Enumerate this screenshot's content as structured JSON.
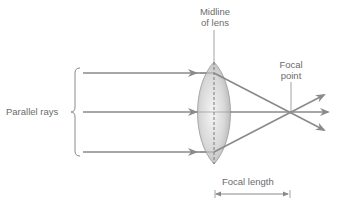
{
  "diagram": {
    "labels": {
      "midline_line1": "Midline",
      "midline_line2": "of lens",
      "focal_point_line1": "Focal",
      "focal_point_line2": "point",
      "parallel_rays": "Parallel rays",
      "focal_length": "Focal length"
    },
    "colors": {
      "ray": "#8a8a8a",
      "text": "#6b6b6b",
      "lens_edge": "#9a9a9a",
      "lens_fill_light": "#f2f2f2",
      "lens_fill_dark": "#bdbdbd"
    },
    "geometry": {
      "lens_center_x": 214,
      "lens_center_y": 112,
      "ray_y": [
        73,
        112,
        152
      ],
      "focal_point": [
        290,
        112
      ]
    }
  }
}
